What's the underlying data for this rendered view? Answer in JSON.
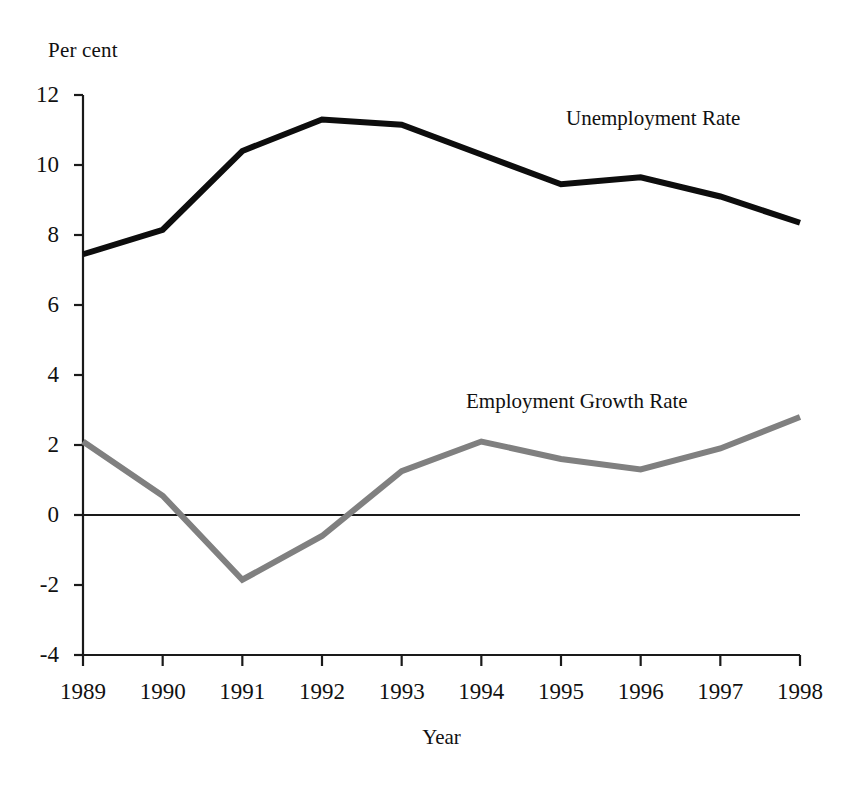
{
  "chart_data": {
    "type": "line",
    "title": "",
    "subtitle": "",
    "xlabel": "Year",
    "ylabel": "Per cent",
    "unit_label": "Per cent",
    "categories": [
      "1989",
      "1990",
      "1991",
      "1992",
      "1993",
      "1994",
      "1995",
      "1996",
      "1997",
      "1998"
    ],
    "x": [
      1989,
      1990,
      1991,
      1992,
      1993,
      1994,
      1995,
      1996,
      1997,
      1998
    ],
    "xlim": [
      1989,
      1998
    ],
    "ylim": [
      -4,
      12
    ],
    "y_ticks": [
      12,
      10,
      8,
      6,
      4,
      2,
      0,
      -2,
      -4
    ],
    "y_tick_labels": [
      "12",
      "10",
      "8",
      "6",
      "4",
      "2",
      "0",
      "-2",
      "-4"
    ],
    "x_tick_labels": [
      "1989",
      "1990",
      "1991",
      "1992",
      "1993",
      "1994",
      "1995",
      "1996",
      "1997",
      "1998"
    ],
    "grid": false,
    "zero_line": true,
    "legend_position": "inline-annotation",
    "series": [
      {
        "name": "Unemployment Rate",
        "label": "Unemployment Rate",
        "color": "#0d0d0d",
        "line_width": 6,
        "values": [
          7.45,
          8.15,
          10.4,
          11.3,
          11.15,
          10.3,
          9.45,
          9.65,
          9.1,
          8.35
        ]
      },
      {
        "name": "Employment Growth Rate",
        "label": "Employment Growth Rate",
        "color": "#808080",
        "line_width": 6,
        "values": [
          2.1,
          0.55,
          -1.85,
          -0.6,
          1.25,
          2.1,
          1.6,
          1.3,
          1.9,
          2.8
        ]
      }
    ],
    "annotations": [
      {
        "text": "Unemployment Rate",
        "series": "Unemployment Rate",
        "x_px": 566,
        "y_px": 108
      },
      {
        "text": "Employment Growth Rate",
        "series": "Employment Growth Rate",
        "x_px": 466,
        "y_px": 391
      }
    ]
  },
  "axes": {
    "unit_label": "Per cent",
    "x_title": "Year"
  }
}
